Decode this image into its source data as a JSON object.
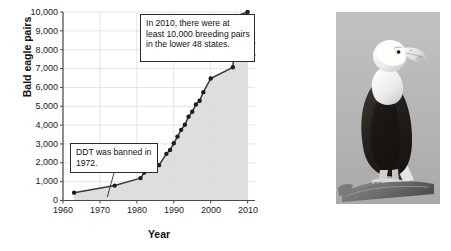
{
  "figure": {
    "photo_alt": "bald-eagle-perched-photo"
  },
  "chart_data": {
    "type": "line",
    "title": "",
    "xlabel": "Year",
    "ylabel": "Bald eagle pairs",
    "xlim": [
      1960,
      2012
    ],
    "ylim": [
      0,
      10000
    ],
    "grid": true,
    "legend": "none",
    "x_ticks": [
      "1960",
      "1970",
      "1980",
      "1990",
      "2000",
      "2010"
    ],
    "x_tick_values": [
      1960,
      1970,
      1980,
      1990,
      2000,
      2010
    ],
    "y_ticks": [
      "0",
      "1,000",
      "2,000",
      "3,000",
      "4,000",
      "5,000",
      "6,000",
      "7,000",
      "8,000",
      "9,000",
      "10,000"
    ],
    "y_tick_values": [
      0,
      1000,
      2000,
      3000,
      4000,
      5000,
      6000,
      7000,
      8000,
      9000,
      10000
    ],
    "series": [
      {
        "name": "Bald eagle breeding pairs",
        "marker": "filled-circle",
        "line_color": "#3a3a3a",
        "fill_color": "#d8d8d8",
        "x": [
          1963,
          1974,
          1981,
          1982,
          1984,
          1986,
          1988,
          1989,
          1990,
          1991,
          1992,
          1993,
          1994,
          1995,
          1996,
          1997,
          1998,
          2000,
          2006,
          2007,
          2010
        ],
        "values": [
          417,
          791,
          1188,
          1480,
          1757,
          1875,
          2475,
          2680,
          3035,
          3391,
          3749,
          4015,
          4449,
          4712,
          5094,
          5295,
          5748,
          6471,
          7066,
          9789,
          10000
        ]
      }
    ],
    "annotations": [
      {
        "id": "ddt-callout",
        "text": "DDT was banned in 1972.",
        "points_to_year": 1972
      },
      {
        "id": "pairs-2010-callout",
        "text": "In 2010, there were at least 10,000 breeding pairs in the lower 48 states.",
        "points_to_year": 2010
      }
    ],
    "colors": {
      "line": "#3a3a3a",
      "marker": "#1c1c1c",
      "fill": "#d8d8d8",
      "grid": "#d9dde0",
      "axis": "#4a4a4a",
      "text": "#111111"
    }
  }
}
